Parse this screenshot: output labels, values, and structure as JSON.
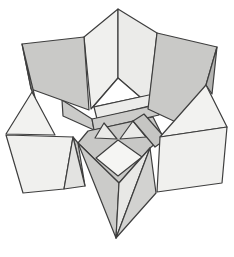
{
  "figure": {
    "name": "origami-star-diagram",
    "description_label": "",
    "canvas": {
      "width": 234,
      "height": 257,
      "background": "#ffffff"
    },
    "stroke": {
      "color": "#3e3e3e",
      "width": 1.2
    },
    "palette": {
      "light": "#f0f0ee",
      "lighter": "#f5f5f3",
      "mid": "#c9c9c7",
      "dark": "#b4b4b2",
      "white": "#ffffff"
    },
    "polygons": [
      {
        "name": "tent-left-face",
        "fill": "#f0f0ee",
        "points": "118,9 84,37 91,109 118,78"
      },
      {
        "name": "tent-right-face",
        "fill": "#ebebe9",
        "points": "118,9 157,33 150,96 140,97 118,78"
      },
      {
        "name": "center-white-opening",
        "fill": "#ffffff",
        "points": "118,78 93,107 140,97"
      },
      {
        "name": "strip-upper-light",
        "fill": "#ececea",
        "points": "94,107 158,93 161,103 97,119"
      },
      {
        "name": "strip-left-mid",
        "fill": "#cbcbc9",
        "points": "62,100 92,119 94,130 63,116"
      },
      {
        "name": "strip-center-mid",
        "fill": "#cbcbc9",
        "points": "92,119 156,105 159,115 94,130"
      },
      {
        "name": "center-band",
        "fill": "#c8c8c6",
        "points": "88,131 153,117 163,137 150,148 119,183 78,143"
      },
      {
        "name": "center-tri-left",
        "fill": "#eaeae8",
        "points": "95,138 117,139 104,123"
      },
      {
        "name": "center-tri-right",
        "fill": "#eaeae8",
        "points": "120,139 146,137 133,121"
      },
      {
        "name": "center-diamond",
        "fill": "#f5f5f3",
        "points": "118,140 96,158 118,176 142,157"
      },
      {
        "name": "strip-right-mid",
        "fill": "#c5c5c3",
        "points": "133,121 144,114 166,139 155,147"
      },
      {
        "name": "upper-left-point-face",
        "fill": "#c9c9c7",
        "points": "22,44 84,37 89,110 31,89"
      },
      {
        "name": "upper-left-side-sliver",
        "fill": "#b4b4b2",
        "points": "22,44 39,114 31,88"
      },
      {
        "name": "left-point-top-tri",
        "fill": "#f2f2f0",
        "points": "32,92 6,134 55,135"
      },
      {
        "name": "left-flank",
        "fill": "#c0c0be",
        "points": "73,137 78,143 85,186"
      },
      {
        "name": "left-point-quad",
        "fill": "#f0f0ee",
        "points": "6,135 73,137 64,189 23,193"
      },
      {
        "name": "left-point-fold",
        "fill": "#e3e3e1",
        "points": "73,137 85,186 64,189"
      },
      {
        "name": "beak-left-face",
        "fill": "#cbcbc9",
        "points": "78,143 119,183 116,238"
      },
      {
        "name": "beak-right-face",
        "fill": "#e8e8e6",
        "points": "119,183 150,148 116,238"
      },
      {
        "name": "beak-right-flank",
        "fill": "#d2d2d0",
        "points": "150,148 156,193 116,238"
      },
      {
        "name": "upper-right-point-face",
        "fill": "#c9c9c7",
        "points": "157,33 217,47 206,85 178,123 148,109"
      },
      {
        "name": "upper-right-side-sliver",
        "fill": "#b4b4b2",
        "points": "217,47 212,94 206,85"
      },
      {
        "name": "right-point-top-tri",
        "fill": "#f2f2f0",
        "points": "206,85 160,137 227,127"
      },
      {
        "name": "right-point-quad",
        "fill": "#f0f0ee",
        "points": "160,137 227,127 222,183 157,192"
      }
    ]
  }
}
